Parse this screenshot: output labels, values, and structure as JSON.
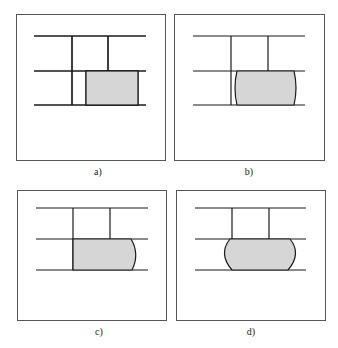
{
  "figure": {
    "panels": [
      {
        "id": "a",
        "label": "a)",
        "description": "Brick course with shaded block inserted between joints, rectangular"
      },
      {
        "id": "b",
        "label": "b)",
        "description": "Shaded block with slightly curved (bulging) side faces"
      },
      {
        "id": "c",
        "label": "c)",
        "description": "Shaded block with right side bulged outward"
      },
      {
        "id": "d",
        "label": "d)",
        "description": "Shaded block with both sides bulged, barrel shape"
      }
    ],
    "colors": {
      "line": "#1a1a1a",
      "fill": "#d6d6d6",
      "border": "#555555"
    }
  }
}
